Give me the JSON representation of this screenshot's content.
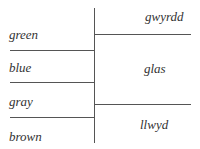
{
  "diagram": {
    "title": "",
    "left_column": {
      "language": "English",
      "terms": [
        "green",
        "blue",
        "gray",
        "brown"
      ]
    },
    "right_column": {
      "language": "Welsh",
      "terms": [
        "gwyrdd",
        "glas",
        "llwyd"
      ]
    },
    "colors": {
      "line": "#555555",
      "text": "#333333",
      "background": "#ffffff"
    }
  }
}
